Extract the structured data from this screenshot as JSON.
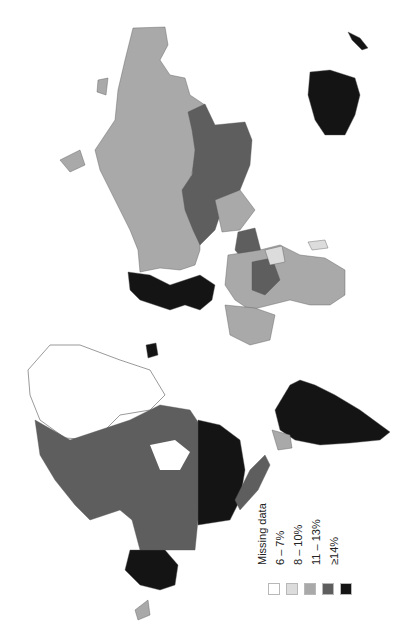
{
  "figure": {
    "type": "choropleth world map",
    "orientation": "rotated 90 degrees clockwise (north to the left)"
  },
  "legend": {
    "items": [
      {
        "label": "Missing data",
        "color": "#ffffff"
      },
      {
        "label": "6 – 7%",
        "color": "#dcdcdc"
      },
      {
        "label": "8 – 10%",
        "color": "#a9a9a9"
      },
      {
        "label": "11 – 13%",
        "color": "#5e5e5e"
      },
      {
        "label": "≥14%",
        "color": "#141414"
      }
    ]
  },
  "regions": [
    {
      "name": "Russia",
      "class": "8 – 10%"
    },
    {
      "name": "China",
      "class": "11 – 13%"
    },
    {
      "name": "Kazakhstan",
      "class": "11 – 13%"
    },
    {
      "name": "Mongolia",
      "class": "11 – 13%"
    },
    {
      "name": "Australia",
      "class": "≥14%"
    },
    {
      "name": "Western Europe",
      "class": "≥14%"
    },
    {
      "name": "Canada",
      "class": "11 – 13%"
    },
    {
      "name": "United States",
      "class": "≥14%"
    },
    {
      "name": "Alaska",
      "class": "≥14%"
    },
    {
      "name": "Mexico",
      "class": "11 – 13%"
    },
    {
      "name": "South America (Brazil etc.)",
      "class": "≥14%"
    },
    {
      "name": "Greenland",
      "class": "Missing data"
    },
    {
      "name": "Africa (most countries)",
      "class": "8 – 10%"
    }
  ]
}
